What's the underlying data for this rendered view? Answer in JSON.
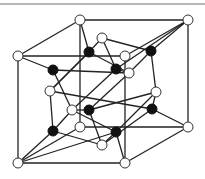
{
  "diagram": {
    "title": "",
    "type": "crystal-lattice-cube",
    "colors": {
      "edge": "#222222",
      "white_node": "#ffffff",
      "black_node": "#111111",
      "top_rule": "#b8b8b8"
    },
    "node_radius": 5,
    "nodes": [
      {
        "id": "c1",
        "x": 18,
        "y": 56,
        "kind": "white"
      },
      {
        "id": "c2",
        "x": 80,
        "y": 20,
        "kind": "white"
      },
      {
        "id": "c3",
        "x": 188,
        "y": 20,
        "kind": "white"
      },
      {
        "id": "c4",
        "x": 125,
        "y": 56,
        "kind": "white"
      },
      {
        "id": "c5",
        "x": 18,
        "y": 163,
        "kind": "white"
      },
      {
        "id": "c6",
        "x": 125,
        "y": 163,
        "kind": "white"
      },
      {
        "id": "c7",
        "x": 188,
        "y": 127,
        "kind": "white"
      },
      {
        "id": "c8",
        "x": 80,
        "y": 127,
        "kind": "white"
      },
      {
        "id": "w1",
        "x": 102,
        "y": 38,
        "kind": "white"
      },
      {
        "id": "w2",
        "x": 129,
        "y": 73,
        "kind": "white"
      },
      {
        "id": "w3",
        "x": 156,
        "y": 92,
        "kind": "white"
      },
      {
        "id": "w4",
        "x": 50,
        "y": 91,
        "kind": "white"
      },
      {
        "id": "w5",
        "x": 72,
        "y": 110,
        "kind": "white"
      },
      {
        "id": "w6",
        "x": 102,
        "y": 145,
        "kind": "white"
      },
      {
        "id": "b1",
        "x": 89,
        "y": 52,
        "kind": "black"
      },
      {
        "id": "b2",
        "x": 53,
        "y": 70,
        "kind": "black"
      },
      {
        "id": "b3",
        "x": 116,
        "y": 69,
        "kind": "black"
      },
      {
        "id": "b4",
        "x": 151,
        "y": 51,
        "kind": "black"
      },
      {
        "id": "b5",
        "x": 89,
        "y": 110,
        "kind": "black"
      },
      {
        "id": "b6",
        "x": 152,
        "y": 109,
        "kind": "black"
      },
      {
        "id": "b7",
        "x": 53,
        "y": 131,
        "kind": "black"
      },
      {
        "id": "b8",
        "x": 116,
        "y": 132,
        "kind": "black"
      }
    ],
    "edges": [
      [
        "c1",
        "c2"
      ],
      [
        "c2",
        "c3"
      ],
      [
        "c3",
        "c4"
      ],
      [
        "c4",
        "c1"
      ],
      [
        "c5",
        "c6"
      ],
      [
        "c6",
        "c7"
      ],
      [
        "c7",
        "c8"
      ],
      [
        "c8",
        "c5"
      ],
      [
        "c1",
        "c5"
      ],
      [
        "c2",
        "c8"
      ],
      [
        "c3",
        "c7"
      ],
      [
        "c4",
        "c6"
      ],
      [
        "c1",
        "b2"
      ],
      [
        "c2",
        "b1"
      ],
      [
        "c3",
        "b4"
      ],
      [
        "c3",
        "b3"
      ],
      [
        "c5",
        "b7"
      ],
      [
        "c5",
        "b8"
      ],
      [
        "c7",
        "b6"
      ],
      [
        "c6",
        "b8"
      ],
      [
        "b1",
        "w1"
      ],
      [
        "b1",
        "w4"
      ],
      [
        "b1",
        "w2"
      ],
      [
        "w1",
        "b3"
      ],
      [
        "w1",
        "b4"
      ],
      [
        "b2",
        "w2"
      ],
      [
        "b2",
        "w5"
      ],
      [
        "b3",
        "w2"
      ],
      [
        "b3",
        "w5"
      ],
      [
        "b4",
        "w3"
      ],
      [
        "b4",
        "w2"
      ],
      [
        "w4",
        "b7"
      ],
      [
        "w4",
        "b6"
      ],
      [
        "w4",
        "b1"
      ],
      [
        "w5",
        "b5"
      ],
      [
        "w5",
        "b8"
      ],
      [
        "b5",
        "w2"
      ],
      [
        "b5",
        "w6"
      ],
      [
        "b5",
        "w3"
      ],
      [
        "w3",
        "b6"
      ],
      [
        "b6",
        "w6"
      ],
      [
        "b7",
        "w5"
      ],
      [
        "b8",
        "w3"
      ],
      [
        "w6",
        "b7"
      ],
      [
        "w6",
        "b8"
      ]
    ]
  }
}
